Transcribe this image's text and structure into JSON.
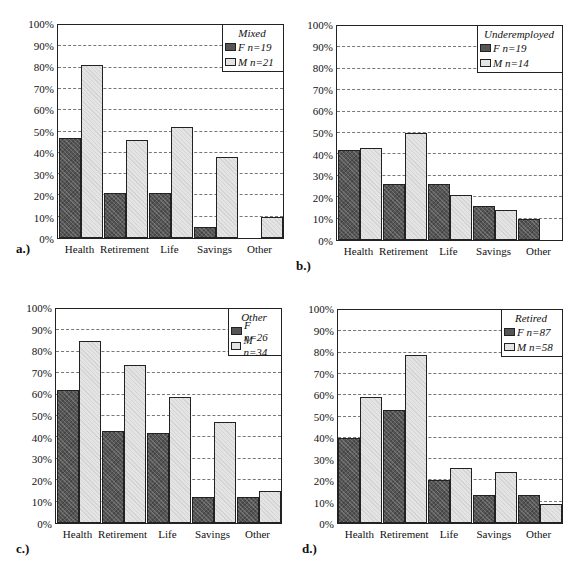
{
  "chart_data": [
    {
      "type": "bar",
      "panel_label": "a.)",
      "title": "Mixed",
      "categories": [
        "Health",
        "Retirement",
        "Life",
        "Savings",
        "Other"
      ],
      "series": [
        {
          "name": "F n=19",
          "values": [
            47,
            21,
            21,
            5,
            0
          ]
        },
        {
          "name": "M n=21",
          "values": [
            81,
            46,
            52,
            38,
            10
          ]
        }
      ],
      "yticks": [
        "0%",
        "10%",
        "20%",
        "30%",
        "40%",
        "50%",
        "60%",
        "70%",
        "80%",
        "90%",
        "100%"
      ],
      "ylim": [
        0,
        100
      ],
      "xlabel": "",
      "ylabel": "",
      "grid": true,
      "legend_position": "top-right"
    },
    {
      "type": "bar",
      "panel_label": "b.)",
      "title": "Underemployed",
      "categories": [
        "Health",
        "Retirement",
        "Life",
        "Savings",
        "Other"
      ],
      "series": [
        {
          "name": "F n=19",
          "values": [
            42,
            26,
            26,
            16,
            10
          ]
        },
        {
          "name": "M n=14",
          "values": [
            43,
            50,
            21,
            14,
            0
          ]
        }
      ],
      "yticks": [
        "0%",
        "10%",
        "20%",
        "30%",
        "40%",
        "50%",
        "60%",
        "70%",
        "80%",
        "90%",
        "100%"
      ],
      "ylim": [
        0,
        100
      ],
      "xlabel": "",
      "ylabel": "",
      "grid": true,
      "legend_position": "top-right"
    },
    {
      "type": "bar",
      "panel_label": "c.)",
      "title": "Other",
      "categories": [
        "Health",
        "Retirement",
        "Life",
        "Savings",
        "Other"
      ],
      "series": [
        {
          "name": "F n=26",
          "values": [
            62,
            43,
            42,
            12,
            12
          ]
        },
        {
          "name": "M n=34",
          "values": [
            85,
            74,
            59,
            47,
            15
          ]
        }
      ],
      "yticks": [
        "0%",
        "10%",
        "20%",
        "30%",
        "40%",
        "50%",
        "60%",
        "70%",
        "80%",
        "90%",
        "100%"
      ],
      "ylim": [
        0,
        100
      ],
      "xlabel": "",
      "ylabel": "",
      "grid": true,
      "legend_position": "top-right"
    },
    {
      "type": "bar",
      "panel_label": "d.)",
      "title": "Retired",
      "categories": [
        "Health",
        "Retirement",
        "Life",
        "Savings",
        "Other"
      ],
      "series": [
        {
          "name": "F n=87",
          "values": [
            40,
            53,
            20,
            13,
            13
          ]
        },
        {
          "name": "M n=58",
          "values": [
            59,
            79,
            26,
            24,
            9
          ]
        }
      ],
      "yticks": [
        "0%",
        "10%",
        "20%",
        "30%",
        "40%",
        "50%",
        "60%",
        "70%",
        "80%",
        "90%",
        "100%"
      ],
      "ylim": [
        0,
        100
      ],
      "xlabel": "",
      "ylabel": "",
      "grid": true,
      "legend_position": "top-right"
    }
  ],
  "colors": {
    "female": "#555555",
    "male": "#e4e4e4",
    "border": "#222222",
    "grid": "#777777"
  }
}
